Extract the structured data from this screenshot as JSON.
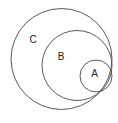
{
  "diagram": {
    "type": "euler-nested-circles",
    "background_color": "#ffffff",
    "stroke_color": "#5a5a5a",
    "label_color": "#222222",
    "stroke_width": 1,
    "canvas": {
      "width": 118,
      "height": 123
    },
    "sets": [
      {
        "id": "C",
        "label": "C",
        "cx": 61.5,
        "cy": 59,
        "r": 50.5,
        "label_x": 33,
        "label_y": 40
      },
      {
        "id": "B",
        "label": "B",
        "cx": 77,
        "cy": 65.5,
        "r": 35,
        "label_x": 61,
        "label_y": 57
      },
      {
        "id": "A",
        "label": "A",
        "cx": 96,
        "cy": 76,
        "r": 16,
        "label_x": 94.5,
        "label_y": 74.5
      }
    ]
  }
}
